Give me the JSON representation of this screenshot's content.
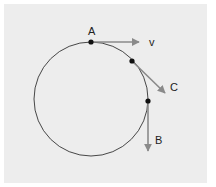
{
  "diagram": {
    "background_color": "#ededed",
    "circle": {
      "cx": 91,
      "cy": 99,
      "r": 57,
      "stroke": "#333333"
    },
    "points": [
      {
        "id": "A",
        "label": "A",
        "x": 91,
        "y": 42
      },
      {
        "id": "C",
        "label": "",
        "x": 132,
        "y": 61
      },
      {
        "id": "B",
        "label": "",
        "x": 148,
        "y": 101
      }
    ],
    "vectors": [
      {
        "id": "v",
        "label": "v",
        "from": [
          91,
          42
        ],
        "to": [
          140,
          42
        ]
      },
      {
        "id": "C",
        "label": "C",
        "from": [
          132,
          61
        ],
        "to": [
          165,
          93
        ]
      },
      {
        "id": "B",
        "label": "B",
        "from": [
          148,
          101
        ],
        "to": [
          148,
          152
        ]
      }
    ],
    "labels": {
      "A": "A",
      "v": "v",
      "C": "C",
      "B": "B"
    },
    "arrow_color": "#8a8a8a"
  }
}
